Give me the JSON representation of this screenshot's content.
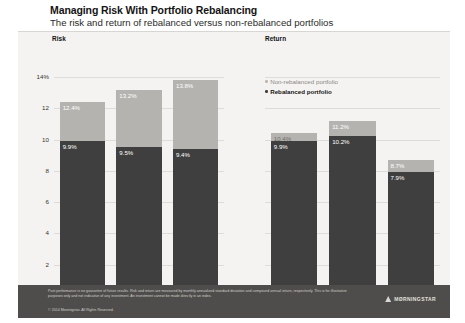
{
  "heading": {
    "title": "Managing Risk With Portfolio Rebalancing",
    "subtitle": "The risk and return of rebalanced versus non-rebalanced portfolios"
  },
  "legend": {
    "non_rebalanced": "Non-rebalanced portfolio",
    "rebalanced": "Rebalanced portfolio"
  },
  "panels": {
    "risk_heading": "Risk",
    "return_heading": "Return"
  },
  "footer": {
    "footnote": "Past performance is no guarantee of future results. Risk and return are measured by monthly annualized standard deviation and compound annual return, respectively. This is for illustrative purposes only and not indicative of any investment. An investment cannot be made directly in an index.",
    "copyright": "© 2014 Morningstar. All Rights Reserved.",
    "brand": "MØRNINGSTAR"
  },
  "chart_data": [
    {
      "type": "bar",
      "title": "Risk",
      "xlabel": "",
      "ylabel": "",
      "ylim": [
        0,
        14
      ],
      "yticks": [
        0,
        2,
        4,
        6,
        8,
        10,
        12,
        14
      ],
      "ytick_labels": [
        "0",
        "2",
        "4",
        "6",
        "8",
        "10",
        "12",
        "14%"
      ],
      "grid": true,
      "legend_position": "top-right-shared",
      "categories": [
        "Jan 1970–\nDec 2013",
        "Jan 1980–\nDec 2013",
        "Jan 1990–\nDec 2013"
      ],
      "category_lines": [
        [
          "Jan 1970–",
          "Dec 2013"
        ],
        [
          "Jan 1980–",
          "Dec 2013"
        ],
        [
          "Jan 1990–",
          "Dec 2013"
        ]
      ],
      "series": [
        {
          "name": "Rebalanced portfolio",
          "color": "#3f3f3f",
          "values": [
            9.9,
            9.5,
            9.4
          ],
          "labels": [
            "9.9%",
            "9.5%",
            "9.4%"
          ]
        },
        {
          "name": "Non-rebalanced portfolio",
          "color": "#b5b3af",
          "values": [
            12.4,
            13.2,
            13.8
          ],
          "labels": [
            "12.4%",
            "13.2%",
            "13.8%"
          ]
        }
      ]
    },
    {
      "type": "bar",
      "title": "Return",
      "xlabel": "",
      "ylabel": "",
      "ylim": [
        0,
        14
      ],
      "yticks": [
        0,
        2,
        4,
        6,
        8,
        10,
        12,
        14
      ],
      "grid": true,
      "legend_position": "top-left",
      "categories": [
        "Jan 1970–\nDec 2013",
        "Jan 1980–\nDec 2013",
        "Jan 1990–\nDec 2013"
      ],
      "category_lines": [
        [
          "Jan 1970–",
          "Dec 2013"
        ],
        [
          "Jan 1980–",
          "Dec 2013"
        ],
        [
          "Jan 1990–",
          "Dec 2013"
        ]
      ],
      "series": [
        {
          "name": "Rebalanced portfolio",
          "color": "#3f3f3f",
          "values": [
            9.9,
            10.2,
            7.9
          ],
          "labels": [
            "9.9%",
            "10.2%",
            "7.9%"
          ]
        },
        {
          "name": "Non-rebalanced portfolio",
          "color": "#b5b3af",
          "values": [
            10.4,
            11.2,
            8.7
          ],
          "labels": [
            "10.4%",
            "11.2%",
            "8.7%"
          ]
        }
      ]
    }
  ]
}
